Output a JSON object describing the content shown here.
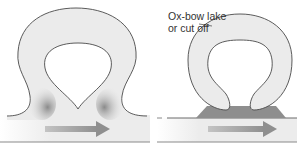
{
  "diagram": {
    "panels": [
      {
        "id": "meander-neck-narrowing",
        "description": "Meander loop with narrowing neck; erosion on outer bends"
      },
      {
        "id": "oxbow-cut-off",
        "description": "Neck breached; river straightens and loop is cut off"
      }
    ],
    "labels": {
      "oxbow_line1": "Ox-bow lake",
      "oxbow_line2": "or cut off"
    },
    "flow_direction": "right",
    "colors": {
      "water_fill": "#ebebeb",
      "outline": "#4a4a4a",
      "deposit_shading": "#8e8e8e",
      "arrow": "#9a9a9a",
      "channel_line": "#8a8a8a",
      "background": "#ffffff"
    }
  }
}
